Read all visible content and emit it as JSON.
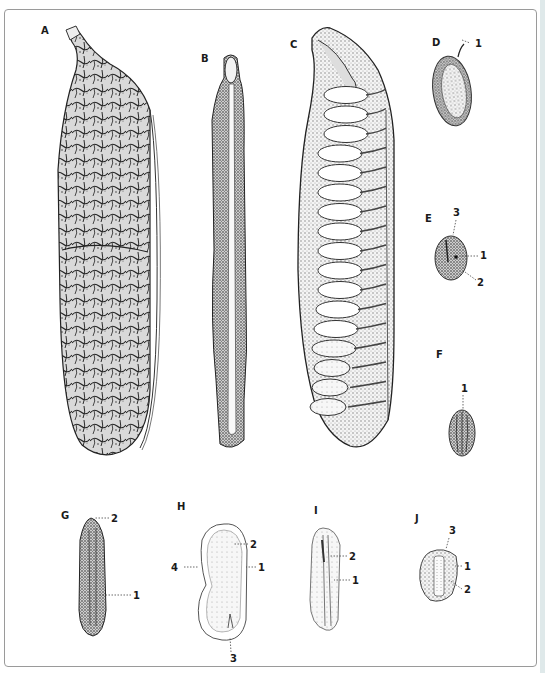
{
  "plate": {
    "panels": [
      {
        "id": "A",
        "label": "A",
        "x": 41,
        "y": 34,
        "kind": "pod-exterior"
      },
      {
        "id": "B",
        "label": "B",
        "x": 201,
        "y": 62,
        "kind": "pod-edge"
      },
      {
        "id": "C",
        "label": "C",
        "x": 290,
        "y": 48,
        "kind": "pod-section"
      },
      {
        "id": "D",
        "label": "D",
        "x": 432,
        "y": 46,
        "kind": "seed"
      },
      {
        "id": "E",
        "label": "E",
        "x": 425,
        "y": 222,
        "kind": "seed"
      },
      {
        "id": "F",
        "label": "F",
        "x": 436,
        "y": 358,
        "kind": "seed"
      },
      {
        "id": "G",
        "label": "G",
        "x": 61,
        "y": 519,
        "kind": "seed"
      },
      {
        "id": "H",
        "label": "H",
        "x": 177,
        "y": 510,
        "kind": "seed-section"
      },
      {
        "id": "I",
        "label": "I",
        "x": 314,
        "y": 514,
        "kind": "seed-section"
      },
      {
        "id": "J",
        "label": "J",
        "x": 415,
        "y": 522,
        "kind": "seed-section"
      }
    ],
    "annotations": [
      {
        "panel": "D",
        "text": "1",
        "x": 475,
        "y": 47,
        "from": [
          462,
          40
        ],
        "to": [
          470,
          43
        ]
      },
      {
        "panel": "E",
        "text": "3",
        "x": 453,
        "y": 216,
        "from": [
          456,
          220
        ],
        "to": [
          453,
          235
        ]
      },
      {
        "panel": "E",
        "text": "1",
        "x": 480,
        "y": 259,
        "from": [
          478,
          256
        ],
        "to": [
          460,
          256
        ]
      },
      {
        "panel": "E",
        "text": "2",
        "x": 477,
        "y": 286,
        "from": [
          476,
          280
        ],
        "to": [
          465,
          272
        ]
      },
      {
        "panel": "F",
        "text": "1",
        "x": 461,
        "y": 392,
        "from": [
          463,
          395
        ],
        "to": [
          463,
          411
        ]
      },
      {
        "panel": "G",
        "text": "2",
        "x": 111,
        "y": 522,
        "from": [
          109,
          518
        ],
        "to": [
          94,
          518
        ]
      },
      {
        "panel": "G",
        "text": "1",
        "x": 133,
        "y": 599,
        "from": [
          131,
          595
        ],
        "to": [
          98,
          595
        ]
      },
      {
        "panel": "H",
        "text": "2",
        "x": 250,
        "y": 548,
        "from": [
          248,
          544
        ],
        "to": [
          233,
          544
        ]
      },
      {
        "panel": "H",
        "text": "1",
        "x": 258,
        "y": 571,
        "from": [
          256,
          567
        ],
        "to": [
          246,
          567
        ]
      },
      {
        "panel": "H",
        "text": "4",
        "x": 171,
        "y": 571,
        "from": [
          184,
          567
        ],
        "to": [
          198,
          567
        ]
      },
      {
        "panel": "H",
        "text": "3",
        "x": 230,
        "y": 662,
        "from": [
          231,
          652
        ],
        "to": [
          230,
          637
        ]
      },
      {
        "panel": "I",
        "text": "2",
        "x": 349,
        "y": 560,
        "from": [
          347,
          556
        ],
        "to": [
          330,
          556
        ]
      },
      {
        "panel": "I",
        "text": "1",
        "x": 352,
        "y": 584,
        "from": [
          350,
          580
        ],
        "to": [
          334,
          580
        ]
      },
      {
        "panel": "J",
        "text": "3",
        "x": 449,
        "y": 534,
        "from": [
          449,
          538
        ],
        "to": [
          446,
          549
        ]
      },
      {
        "panel": "J",
        "text": "1",
        "x": 464,
        "y": 570,
        "from": [
          462,
          566
        ],
        "to": [
          455,
          566
        ]
      },
      {
        "panel": "J",
        "text": "2",
        "x": 464,
        "y": 593,
        "from": [
          462,
          589
        ],
        "to": [
          449,
          580
        ]
      }
    ]
  },
  "colors": {
    "ink": "#1a1a1a",
    "frame": "#9a9a9a",
    "paper": "#ffffff",
    "edge_strip": "#dfe9ea"
  }
}
